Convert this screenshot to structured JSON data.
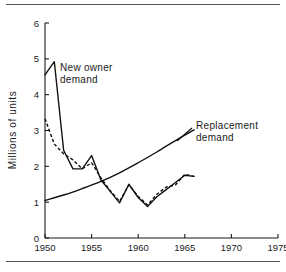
{
  "figure": {
    "name": "new-owner-and-replacement-demand-chart",
    "has_top_rule": true,
    "has_bottom_rule": true
  },
  "chart_data": {
    "type": "line",
    "title": "",
    "xlabel": "",
    "ylabel": "Millions of units",
    "xlim": [
      1950,
      1975
    ],
    "ylim": [
      0,
      6
    ],
    "xticks": [
      1950,
      1955,
      1960,
      1965,
      1970,
      1975
    ],
    "xtick_labels": [
      "1950",
      "1955",
      "1960",
      "1965",
      "1970",
      "1975"
    ],
    "yticks": [
      0,
      1,
      2,
      3,
      4,
      5,
      6
    ],
    "ytick_labels": [
      "0",
      "1",
      "2",
      "3",
      "4",
      "5",
      "6"
    ],
    "grid": false,
    "legend_position": "inline-annotations",
    "annotations": [
      {
        "id": "new-owner-demand",
        "text_line1": "New owner",
        "text_line2": "demand",
        "x": 1951.6,
        "y": 4.35
      },
      {
        "id": "replacement-demand",
        "text_line1": "Replacement",
        "text_line2": "demand",
        "x": 1966.0,
        "y": 3.25
      }
    ],
    "series": [
      {
        "name": "New owner demand",
        "style": "solid",
        "x": [
          1950,
          1951,
          1952,
          1953,
          1954,
          1955,
          1956,
          1957,
          1958,
          1959,
          1960,
          1961,
          1962,
          1963,
          1964,
          1965,
          1966
        ],
        "values": [
          4.55,
          4.92,
          2.45,
          1.93,
          1.93,
          2.3,
          1.62,
          1.3,
          0.98,
          1.5,
          1.13,
          0.88,
          1.15,
          1.35,
          1.55,
          1.75,
          1.72
        ]
      },
      {
        "name": "New owner demand (estimated)",
        "style": "dashed",
        "x": [
          1950,
          1951,
          1952,
          1953,
          1954,
          1955,
          1956,
          1957,
          1958,
          1959,
          1960,
          1961,
          1962,
          1963,
          1964,
          1965,
          1966
        ],
        "values": [
          3.33,
          2.62,
          2.35,
          2.18,
          1.93,
          2.1,
          1.68,
          1.32,
          1.02,
          1.48,
          1.16,
          0.92,
          1.22,
          1.42,
          1.48,
          1.78,
          1.72
        ]
      },
      {
        "name": "Replacement demand",
        "style": "solid-smooth",
        "x": [
          1950,
          1952,
          1954,
          1956,
          1958,
          1960,
          1962,
          1964,
          1966
        ],
        "values": [
          1.05,
          1.2,
          1.38,
          1.58,
          1.82,
          2.1,
          2.4,
          2.72,
          3.02
        ]
      }
    ]
  }
}
